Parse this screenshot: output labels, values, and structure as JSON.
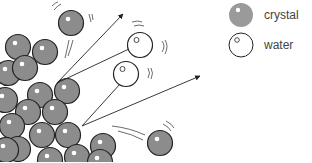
{
  "diagram": {
    "legend": [
      {
        "key": "crystal",
        "label": "crystal",
        "color": "#8c8c8c"
      },
      {
        "key": "water",
        "label": "water",
        "color": "#ffffff"
      }
    ],
    "colors": {
      "crystal_fill": "#8c8c8c",
      "crystal_legend_fill": "#9a9a9a",
      "outline": "#222222",
      "water_fill": "#ffffff"
    },
    "crystal_particles": [
      [
        18,
        47
      ],
      [
        8,
        73
      ],
      [
        45,
        52
      ],
      [
        25,
        68
      ],
      [
        40,
        95
      ],
      [
        67,
        91
      ],
      [
        5,
        100
      ],
      [
        28,
        112
      ],
      [
        55,
        112
      ],
      [
        12,
        126
      ],
      [
        42,
        135
      ],
      [
        68,
        135
      ],
      [
        18,
        149
      ],
      [
        50,
        160
      ],
      [
        77,
        157
      ],
      [
        103,
        146
      ],
      [
        6,
        150
      ],
      [
        100,
        162
      ]
    ],
    "free_crystal_particles": [
      [
        71,
        23
      ],
      [
        160,
        143
      ]
    ],
    "water_molecules": [
      [
        140,
        45
      ],
      [
        126,
        74
      ]
    ],
    "arrows": [
      {
        "from": [
          57,
          83
        ],
        "to": [
          123,
          14
        ]
      },
      {
        "from": [
          57,
          83
        ],
        "to": [
          140,
          45
        ],
        "head": false
      },
      {
        "from": [
          82,
          126
        ],
        "to": [
          126,
          74
        ],
        "head": false
      },
      {
        "from": [
          82,
          126
        ],
        "to": [
          200,
          76
        ]
      }
    ]
  }
}
